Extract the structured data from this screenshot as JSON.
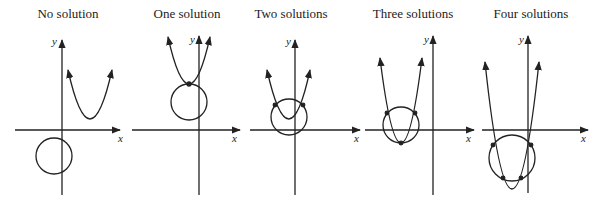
{
  "figure": {
    "panels": [
      {
        "title": "No solution",
        "x_label": "x",
        "y_label": "y"
      },
      {
        "title": "One solution",
        "x_label": "x",
        "y_label": "y"
      },
      {
        "title": "Two solutions",
        "x_label": "x",
        "y_label": "y"
      },
      {
        "title": "Three solutions",
        "x_label": "x",
        "y_label": "y"
      },
      {
        "title": "Four solutions",
        "x_label": "x",
        "y_label": "y"
      }
    ],
    "stroke_color": "#222222"
  }
}
